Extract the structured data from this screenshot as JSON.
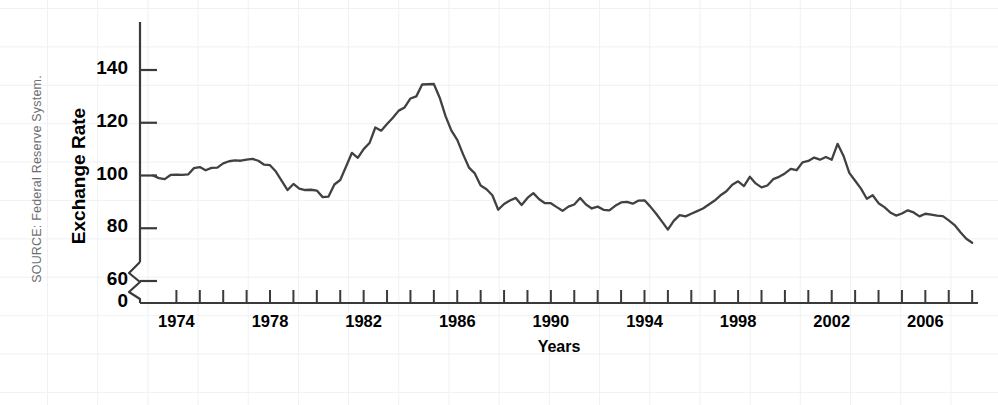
{
  "figure": {
    "source_note": "SOURCE: Federal Reserve System.",
    "line_color": "#414042",
    "axis_color": "#3a3a3c",
    "grid_color": "#f0f1f3"
  },
  "chart_data": {
    "type": "line",
    "title": "",
    "subtitle": "",
    "xlabel": "Years",
    "ylabel": "Exchange Rate",
    "legend": [],
    "legend_position": "none",
    "grid": true,
    "xlim": [
      1973.0,
      2008.25
    ],
    "ylim": [
      70,
      145
    ],
    "y_axis_break": {
      "present": true,
      "between": [
        0,
        60
      ],
      "style": "zigzag"
    },
    "xticks_major": [
      1974,
      1978,
      1982,
      1986,
      1990,
      1994,
      1998,
      2002,
      2006
    ],
    "xticks_minor_every": 1,
    "xtick_labels": [
      "1974",
      "1978",
      "1982",
      "1986",
      "1990",
      "1994",
      "1998",
      "2002",
      "2006"
    ],
    "yticks": [
      0,
      60,
      80,
      100,
      120,
      140
    ],
    "ytick_labels": [
      "0",
      "60",
      "80",
      "100",
      "120",
      "140"
    ],
    "series": [
      {
        "name": "Trade-weighted U.S. dollar exchange rate index",
        "x": [
          1973.0,
          1973.25,
          1973.5,
          1973.75,
          1974.0,
          1974.25,
          1974.5,
          1974.75,
          1975.0,
          1975.25,
          1975.5,
          1975.75,
          1976.0,
          1976.25,
          1976.5,
          1976.75,
          1977.0,
          1977.25,
          1977.5,
          1977.75,
          1978.0,
          1978.25,
          1978.5,
          1978.75,
          1979.0,
          1979.25,
          1979.5,
          1979.75,
          1980.0,
          1980.25,
          1980.5,
          1980.75,
          1981.0,
          1981.25,
          1981.5,
          1981.75,
          1982.0,
          1982.25,
          1982.5,
          1982.75,
          1983.0,
          1983.25,
          1983.5,
          1983.75,
          1984.0,
          1984.25,
          1984.5,
          1984.75,
          1985.0,
          1985.25,
          1985.5,
          1985.75,
          1986.0,
          1986.25,
          1986.5,
          1986.75,
          1987.0,
          1987.25,
          1987.5,
          1987.75,
          1988.0,
          1988.25,
          1988.5,
          1988.75,
          1989.0,
          1989.25,
          1989.5,
          1989.75,
          1990.0,
          1990.25,
          1990.5,
          1990.75,
          1991.0,
          1991.25,
          1991.5,
          1991.75,
          1992.0,
          1992.25,
          1992.5,
          1992.75,
          1993.0,
          1993.25,
          1993.5,
          1993.75,
          1994.0,
          1994.25,
          1994.5,
          1994.75,
          1995.0,
          1995.25,
          1995.5,
          1995.75,
          1996.0,
          1996.25,
          1996.5,
          1996.75,
          1997.0,
          1997.25,
          1997.5,
          1997.75,
          1998.0,
          1998.25,
          1998.5,
          1998.75,
          1999.0,
          1999.25,
          1999.5,
          1999.75,
          2000.0,
          2000.25,
          2000.5,
          2000.75,
          2001.0,
          2001.25,
          2001.5,
          2001.75,
          2002.0,
          2002.25,
          2002.5,
          2002.75,
          2003.0,
          2003.25,
          2003.5,
          2003.75,
          2004.0,
          2004.25,
          2004.5,
          2004.75,
          2005.0,
          2005.25,
          2005.5,
          2005.75,
          2006.0,
          2006.25,
          2006.5,
          2006.75,
          2007.0,
          2007.25,
          2007.5,
          2007.75,
          2008.0
        ],
        "y": [
          100.0,
          99.0,
          98.6,
          100.2,
          100.3,
          100.2,
          100.4,
          102.8,
          103.2,
          102.0,
          102.9,
          103.0,
          104.6,
          105.4,
          105.7,
          105.6,
          106.0,
          106.3,
          105.6,
          104.1,
          103.9,
          101.5,
          98.0,
          94.5,
          96.8,
          95.0,
          94.5,
          94.6,
          94.3,
          91.8,
          92.0,
          96.6,
          98.3,
          103.4,
          108.6,
          106.7,
          110.0,
          112.3,
          118.2,
          117.0,
          119.5,
          121.9,
          124.6,
          125.8,
          129.2,
          130.0,
          134.5,
          134.6,
          134.7,
          129.5,
          122.5,
          117.0,
          113.5,
          108.0,
          103.0,
          100.8,
          96.2,
          94.8,
          92.5,
          87.0,
          89.2,
          90.5,
          91.5,
          88.8,
          91.5,
          93.3,
          91.0,
          89.5,
          89.5,
          88.0,
          86.6,
          88.2,
          89.0,
          91.5,
          89.0,
          87.5,
          88.2,
          87.0,
          86.8,
          88.5,
          89.8,
          90.0,
          89.3,
          90.5,
          90.6,
          88.2,
          85.5,
          82.5,
          79.5,
          82.8,
          85.0,
          84.5,
          85.5,
          86.5,
          87.5,
          89.0,
          90.5,
          92.5,
          94.0,
          96.5,
          97.8,
          96.0,
          99.5,
          97.0,
          95.5,
          96.2,
          98.6,
          99.5,
          100.8,
          102.5,
          102.0,
          105.0,
          105.5,
          106.8,
          106.0,
          107.0,
          106.0,
          112.0,
          107.5,
          101.0,
          98.0,
          95.0,
          91.2,
          92.5,
          89.5,
          88.0,
          86.0,
          84.8,
          85.6,
          86.8,
          86.0,
          84.5,
          85.5,
          85.2,
          84.8,
          84.6,
          83.0,
          81.2,
          78.5,
          76.0,
          74.5
        ]
      }
    ]
  },
  "axis_labels": {
    "y_title": "Exchange Rate",
    "x_title": "Years"
  }
}
